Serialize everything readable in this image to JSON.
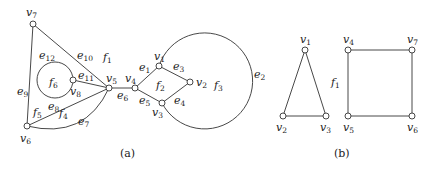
{
  "graph_a": {
    "caption": "(a)",
    "vertices": [
      {
        "id": "v1",
        "base": "v",
        "sub": "1"
      },
      {
        "id": "v2",
        "base": "v",
        "sub": "2"
      },
      {
        "id": "v3",
        "base": "v",
        "sub": "3"
      },
      {
        "id": "v4",
        "base": "v",
        "sub": "4"
      },
      {
        "id": "v5",
        "base": "v",
        "sub": "5"
      },
      {
        "id": "v6",
        "base": "v",
        "sub": "6"
      },
      {
        "id": "v7",
        "base": "v",
        "sub": "7"
      },
      {
        "id": "v8",
        "base": "v",
        "sub": "8"
      }
    ],
    "edges": [
      {
        "id": "e1",
        "base": "e",
        "sub": "1",
        "from": "v4",
        "to": "v1"
      },
      {
        "id": "e2",
        "base": "e",
        "sub": "2",
        "from": "v1",
        "to": "v3",
        "shape": "outer-arc"
      },
      {
        "id": "e3",
        "base": "e",
        "sub": "3",
        "from": "v1",
        "to": "v2"
      },
      {
        "id": "e4",
        "base": "e",
        "sub": "4",
        "from": "v3",
        "to": "v2"
      },
      {
        "id": "e5",
        "base": "e",
        "sub": "5",
        "from": "v4",
        "to": "v3"
      },
      {
        "id": "e6",
        "base": "e",
        "sub": "6",
        "from": "v5",
        "to": "v4"
      },
      {
        "id": "e7",
        "base": "e",
        "sub": "7",
        "from": "v6",
        "to": "v5",
        "shape": "curve"
      },
      {
        "id": "e8",
        "base": "e",
        "sub": "8",
        "from": "v6",
        "to": "v5"
      },
      {
        "id": "e9",
        "base": "e",
        "sub": "9",
        "from": "v7",
        "to": "v6"
      },
      {
        "id": "e10",
        "base": "e",
        "sub": "10",
        "from": "v7",
        "to": "v5"
      },
      {
        "id": "e11",
        "base": "e",
        "sub": "11",
        "from": "v8",
        "to": "v5"
      },
      {
        "id": "e12",
        "base": "e",
        "sub": "12",
        "from": "v8",
        "to": "v8",
        "shape": "loop"
      }
    ],
    "faces": [
      {
        "id": "f1",
        "base": "f",
        "sub": "1"
      },
      {
        "id": "f2",
        "base": "f",
        "sub": "2"
      },
      {
        "id": "f3",
        "base": "f",
        "sub": "3"
      },
      {
        "id": "f4",
        "base": "f",
        "sub": "4"
      },
      {
        "id": "f5",
        "base": "f",
        "sub": "5"
      },
      {
        "id": "f6",
        "base": "f",
        "sub": "6"
      }
    ]
  },
  "graph_b": {
    "caption": "(b)",
    "vertices": [
      {
        "id": "v1",
        "base": "v",
        "sub": "1"
      },
      {
        "id": "v2",
        "base": "v",
        "sub": "2"
      },
      {
        "id": "v3",
        "base": "v",
        "sub": "3"
      },
      {
        "id": "v4",
        "base": "v",
        "sub": "4"
      },
      {
        "id": "v5",
        "base": "v",
        "sub": "5"
      },
      {
        "id": "v6",
        "base": "v",
        "sub": "6"
      },
      {
        "id": "v7",
        "base": "v",
        "sub": "7"
      }
    ],
    "edges": [
      {
        "from": "v1",
        "to": "v2"
      },
      {
        "from": "v1",
        "to": "v3"
      },
      {
        "from": "v2",
        "to": "v3"
      },
      {
        "from": "v4",
        "to": "v7"
      },
      {
        "from": "v4",
        "to": "v5"
      },
      {
        "from": "v7",
        "to": "v6"
      },
      {
        "from": "v5",
        "to": "v6"
      }
    ],
    "faces": [
      {
        "id": "f1",
        "base": "f",
        "sub": "1"
      }
    ]
  }
}
